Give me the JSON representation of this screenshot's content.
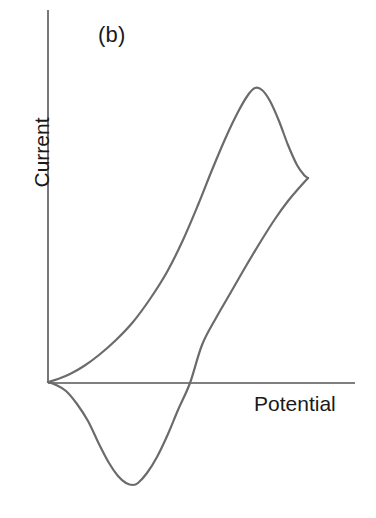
{
  "figure": {
    "panel_label": "(b)",
    "ylabel": "Current",
    "xlabel": "Potential",
    "line_color": "#6b6b6b",
    "axis_color": "#555555",
    "background_color": "#ffffff",
    "text_color": "#1a1a1a"
  },
  "chart_data": {
    "type": "line",
    "title": "(b)",
    "subtitle": "",
    "xlabel": "Potential",
    "ylabel": "Current",
    "xlim": [
      0,
      1
    ],
    "ylim": [
      -1,
      1
    ],
    "grid": false,
    "legend": null,
    "axis_ticks": {
      "x": [],
      "y": []
    },
    "annotations": [
      {
        "text": "(b)",
        "x": 0.17,
        "y": 0.93
      },
      {
        "text": "Potential",
        "x": 0.84,
        "y": -0.03
      },
      {
        "text": "Current",
        "x": -0.08,
        "y": 0.6
      }
    ],
    "series": [
      {
        "name": "forward-anodic-scan",
        "path_points": [
          [
            48,
            382
          ],
          [
            58,
            379
          ],
          [
            70,
            374
          ],
          [
            84,
            366
          ],
          [
            99,
            355
          ],
          [
            116,
            340
          ],
          [
            133,
            322
          ],
          [
            150,
            299
          ],
          [
            167,
            272
          ],
          [
            183,
            240
          ],
          [
            198,
            205
          ],
          [
            212,
            170
          ],
          [
            226,
            137
          ],
          [
            238,
            112
          ],
          [
            248,
            95
          ],
          [
            255,
            88
          ],
          [
            262,
            90
          ],
          [
            270,
            101
          ],
          [
            279,
            121
          ],
          [
            288,
            145
          ],
          [
            297,
            165
          ],
          [
            304,
            175
          ],
          [
            308,
            178
          ]
        ]
      },
      {
        "name": "reverse-cathodic-scan",
        "path_points": [
          [
            308,
            178
          ],
          [
            299,
            188
          ],
          [
            288,
            201
          ],
          [
            275,
            219
          ],
          [
            261,
            241
          ],
          [
            246,
            266
          ],
          [
            231,
            292
          ],
          [
            216,
            318
          ],
          [
            202,
            345
          ],
          [
            190,
            383
          ],
          [
            178,
            410
          ],
          [
            168,
            434
          ],
          [
            157,
            457
          ],
          [
            147,
            473
          ],
          [
            138,
            483
          ],
          [
            133,
            485
          ],
          [
            126,
            483
          ],
          [
            118,
            476
          ],
          [
            109,
            463
          ],
          [
            99,
            444
          ],
          [
            88,
            421
          ],
          [
            77,
            404
          ],
          [
            66,
            391
          ],
          [
            56,
            385
          ],
          [
            48,
            382
          ]
        ]
      }
    ],
    "features": {
      "origin": [
        48,
        382
      ],
      "anodic_peak": {
        "x_px": 255,
        "y_px": 88,
        "label": "anodic (oxidation) peak"
      },
      "switching_point": {
        "x_px": 308,
        "y_px": 178,
        "label": "potential switching point"
      },
      "cathodic_peak": {
        "x_px": 133,
        "y_px": 485,
        "label": "cathodic (reduction) peak"
      },
      "zero_crossing": {
        "x_px": 190,
        "y_px": 383,
        "label": "reverse scan zero-current crossing"
      }
    },
    "axes_geometry": {
      "y_axis": {
        "x_px": 48,
        "y_top_px": 10,
        "y_bottom_px": 383
      },
      "x_axis": {
        "y_px": 383,
        "x_left_px": 48,
        "x_right_px": 355
      }
    }
  }
}
